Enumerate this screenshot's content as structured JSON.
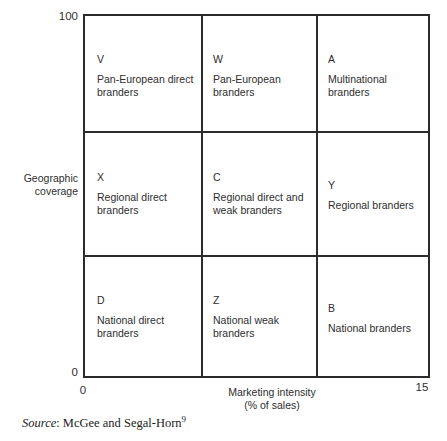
{
  "chart_data": {
    "type": "table",
    "title": "",
    "xlabel": "Marketing intensity\n(% of sales)",
    "ylabel": "Geographic\ncoverage",
    "xlim": [
      0,
      15
    ],
    "ylim": [
      0,
      100
    ],
    "xticklabels": [
      "0",
      "15"
    ],
    "yticklabels": [
      "0",
      "100"
    ],
    "grid": true,
    "rows": 3,
    "columns": 3,
    "cells": [
      {
        "code": "V",
        "desc": "Pan-European direct\nbranders",
        "row": 0,
        "col": 0
      },
      {
        "code": "W",
        "desc": "Pan-European\nbranders",
        "row": 0,
        "col": 1
      },
      {
        "code": "A",
        "desc": "Multinational\nbranders",
        "row": 0,
        "col": 2
      },
      {
        "code": "X",
        "desc": "Regional direct\nbranders",
        "row": 1,
        "col": 0
      },
      {
        "code": "C",
        "desc": "Regional direct and\nweak branders",
        "row": 1,
        "col": 1
      },
      {
        "code": "Y",
        "desc": "Regional branders",
        "row": 1,
        "col": 2
      },
      {
        "code": "D",
        "desc": "National direct\nbranders",
        "row": 2,
        "col": 0
      },
      {
        "code": "Z",
        "desc": "National weak\nbranders",
        "row": 2,
        "col": 1
      },
      {
        "code": "B",
        "desc": "National branders",
        "row": 2,
        "col": 2
      }
    ]
  },
  "axes": {
    "y_max": "100",
    "y_min": "0",
    "y_title": "Geographic\ncoverage",
    "x_min": "0",
    "x_max": "15",
    "x_title": "Marketing intensity\n(% of sales)"
  },
  "source": {
    "label": "Source",
    "separator": ": ",
    "text": "McGee and Segal-Horn",
    "superscript": "9"
  },
  "colors": {
    "line": "#2b2b2b",
    "text": "#2e2e2e",
    "background": "#ffffff"
  }
}
